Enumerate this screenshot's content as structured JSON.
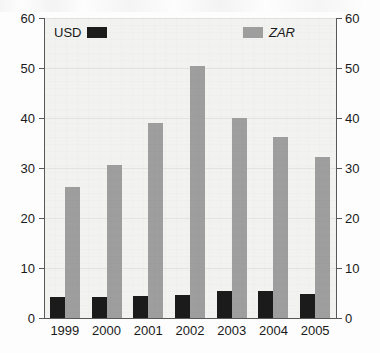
{
  "chart_data": {
    "type": "bar",
    "title": "",
    "xlabel": "",
    "ylabel": "",
    "ylim": [
      0,
      60
    ],
    "yticks": [
      0,
      10,
      20,
      30,
      40,
      50,
      60
    ],
    "ytick_labels": [
      "0",
      "10",
      "20",
      "30",
      "40",
      "50",
      "60"
    ],
    "right_axis": {
      "ylim": [
        0,
        60
      ],
      "yticks": [
        0,
        10,
        20,
        30,
        40,
        50,
        60
      ],
      "ytick_labels": [
        "0",
        "10",
        "20",
        "30",
        "40",
        "50",
        "60"
      ]
    },
    "grid": true,
    "legend_position": "top",
    "categories": [
      "1999",
      "2000",
      "2001",
      "2002",
      "2003",
      "2004",
      "2005"
    ],
    "series": [
      {
        "name": "USD",
        "color": "#1b1b1b",
        "style": "normal",
        "values": [
          4.2,
          4.2,
          4.4,
          4.7,
          5.4,
          5.5,
          4.9
        ]
      },
      {
        "name": "ZAR",
        "color": "#9e9e9e",
        "style": "italic",
        "values": [
          26.2,
          30.7,
          39.0,
          50.5,
          40.1,
          36.2,
          32.2
        ]
      }
    ]
  },
  "colors": {
    "usd": "#1b1b1b",
    "zar": "#9e9e9e",
    "plot_background": "#f2f2f0",
    "axis": "#585858",
    "gridline": "#e3e3e1",
    "text": "#1a1a1a"
  }
}
